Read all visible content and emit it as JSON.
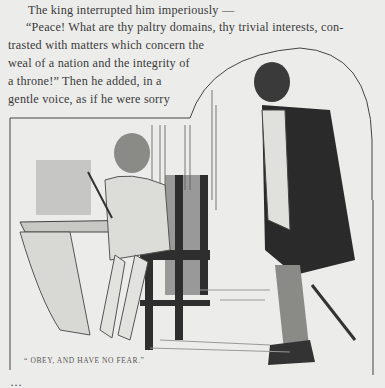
{
  "page": {
    "lines": [
      "The king interrupted him imperiously —",
      "“Peace!  What are thy paltry domains, thy trivial interests, con-",
      "trasted with matters which concern the",
      "weal of a nation and the integrity of",
      "a throne!”  Then he added, in a",
      "gentle voice, as if he were sorry"
    ],
    "illustration": {
      "subject": "boy seated at writing table with quill, cloaked king standing before him",
      "caption": "“ OBEY, AND HAVE NO FEAR.”"
    },
    "cut_off_line": "…"
  }
}
